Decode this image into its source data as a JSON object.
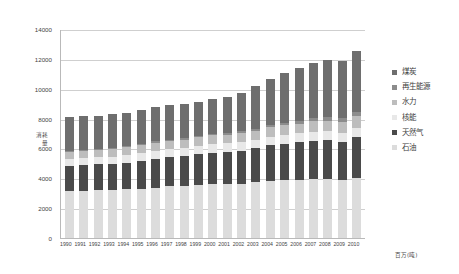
{
  "chart_data": {
    "type": "bar",
    "stacked": true,
    "title": "",
    "subtitle": "",
    "xlabel": "",
    "ylabel": "消耗量",
    "unit_caption": "百万(吨)",
    "ylim": [
      0,
      14000
    ],
    "ytick_step": 2000,
    "yticks": [
      "0",
      "2000",
      "4000",
      "6000",
      "8000",
      "10000",
      "12000",
      "14000"
    ],
    "grid": true,
    "legend_position": "right",
    "categories": [
      "1990",
      "1991",
      "1992",
      "1993",
      "1994",
      "1995",
      "1996",
      "1997",
      "1998",
      "1999",
      "2000",
      "2001",
      "2002",
      "2003",
      "2004",
      "2005",
      "2006",
      "2007",
      "2008",
      "2009",
      "2010"
    ],
    "series": [
      {
        "name": "石油",
        "color": "#dcdcdc",
        "values": [
          3150,
          3160,
          3190,
          3190,
          3250,
          3300,
          3380,
          3460,
          3500,
          3570,
          3600,
          3620,
          3650,
          3720,
          3840,
          3880,
          3910,
          3950,
          3930,
          3880,
          4000
        ]
      },
      {
        "name": "天然气",
        "color": "#4a4a4a",
        "values": [
          1700,
          1730,
          1740,
          1770,
          1800,
          1860,
          1930,
          1940,
          1970,
          2030,
          2120,
          2150,
          2200,
          2280,
          2360,
          2430,
          2490,
          2580,
          2630,
          2570,
          2780
        ]
      },
      {
        "name": "核能",
        "color": "#e8e8e8",
        "values": [
          450,
          470,
          480,
          500,
          510,
          520,
          540,
          540,
          550,
          570,
          580,
          580,
          590,
          590,
          600,
          610,
          610,
          600,
          590,
          580,
          600
        ]
      },
      {
        "name": "水力",
        "color": "#bdbdbd",
        "values": [
          490,
          500,
          500,
          520,
          520,
          540,
          550,
          560,
          560,
          570,
          580,
          570,
          580,
          590,
          620,
          640,
          660,
          680,
          710,
          740,
          780
        ]
      },
      {
        "name": "再生能源",
        "color": "#8c8c8c",
        "values": [
          60,
          62,
          65,
          68,
          72,
          76,
          82,
          88,
          94,
          100,
          110,
          118,
          128,
          140,
          155,
          172,
          192,
          215,
          240,
          265,
          295
        ]
      },
      {
        "name": "煤炭",
        "color": "#6e6e6e",
        "values": [
          2280,
          2250,
          2220,
          2230,
          2240,
          2280,
          2330,
          2330,
          2310,
          2300,
          2350,
          2420,
          2570,
          2840,
          3080,
          3320,
          3530,
          3720,
          3800,
          3840,
          4090
        ]
      }
    ]
  },
  "legend": {
    "items": [
      {
        "label": "煤炭",
        "color": "#6e6e6e"
      },
      {
        "label": "再生能源",
        "color": "#8c8c8c"
      },
      {
        "label": "水力",
        "color": "#bdbdbd"
      },
      {
        "label": "核能",
        "color": "#e8e8e8"
      },
      {
        "label": "天然气",
        "color": "#4a4a4a"
      },
      {
        "label": "石油",
        "color": "#dcdcdc"
      }
    ]
  },
  "axis": {
    "y_title_line1": "消耗",
    "y_title_line2": "量"
  }
}
